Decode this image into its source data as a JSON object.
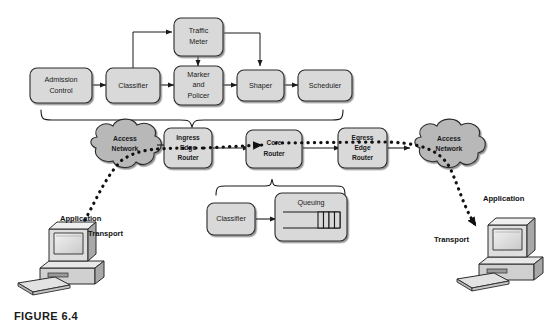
{
  "figure": {
    "caption": "FIGURE 6.4",
    "background_color": "#ffffff",
    "box_fill_color": "#d9d9d9",
    "box_stroke_color": "#2b2b2b",
    "cloud_fill_color": "#b8b8b8",
    "line_color": "#1a1a1a"
  },
  "traffic_conditioning_row": {
    "boxes": [
      {
        "id": "admission-control",
        "label_lines": [
          "Admission",
          "Control"
        ]
      },
      {
        "id": "classifier",
        "label_lines": [
          "Classifier"
        ]
      },
      {
        "id": "marker-and-policer",
        "label_lines": [
          "Marker",
          "and",
          "Policer"
        ]
      },
      {
        "id": "shaper",
        "label_lines": [
          "Shaper"
        ]
      },
      {
        "id": "scheduler",
        "label_lines": [
          "Scheduler"
        ]
      }
    ],
    "traffic_meter": {
      "id": "traffic-meter",
      "label_lines": [
        "Traffic",
        "Meter"
      ]
    }
  },
  "network_row": {
    "left_cloud": {
      "id": "access-network-left",
      "label_lines": [
        "Access",
        "Network"
      ]
    },
    "ingress_edge_router": {
      "id": "ingress-edge-router",
      "label_lines": [
        "Ingress",
        "Edge",
        "Router"
      ]
    },
    "core_router": {
      "id": "core-router",
      "label_lines": [
        "Core",
        "Router"
      ]
    },
    "egress_edge_router": {
      "id": "egress-edge-router",
      "label_lines": [
        "Egress",
        "Edge",
        "Router"
      ]
    },
    "right_cloud": {
      "id": "access-network-right",
      "label_lines": [
        "Access",
        "Network"
      ]
    }
  },
  "core_router_detail": {
    "classifier": {
      "id": "core-classifier",
      "label_lines": [
        "Classifier"
      ]
    },
    "queuing": {
      "id": "queuing",
      "title": "Queuing",
      "filled_cells": 4
    }
  },
  "endpoints": {
    "left_host": {
      "id": "left-workstation",
      "application_label": "Application",
      "transport_label": "Transport"
    },
    "right_host": {
      "id": "right-workstation",
      "application_label": "Application",
      "transport_label": "Transport"
    }
  }
}
